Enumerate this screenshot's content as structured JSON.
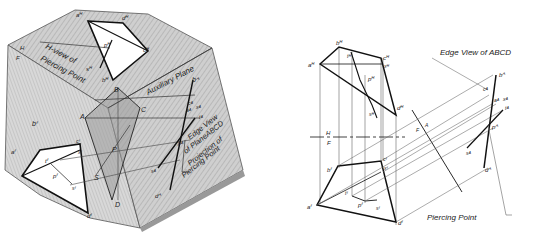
{
  "figure": {
    "left_panel": {
      "description": "Pictorial view of piercing point construction on a block",
      "captions": {
        "h_view": "H-view of",
        "h_view2": "Piercing Point",
        "aux_plane": "Auxiliary Plane",
        "edge_view1": "Edge View",
        "edge_view2": "of PlaneABCD",
        "projection1": "Projection of",
        "projection2": "Piercing Point",
        "h": "H",
        "f": "F"
      },
      "labels": {
        "aH": "aᴴ",
        "dH": "dᴴ",
        "pH": "pᴴ",
        "cH": "cᴴ",
        "sH": "sᴴ",
        "bH": "bᴴ",
        "A": "A",
        "B": "B",
        "C": "C",
        "D": "D",
        "P": "P",
        "S": "S",
        "X": "X",
        "T": "T",
        "bF": "bᶠ",
        "aF": "aᶠ",
        "cF": "cᶠ",
        "xF": "xᶠ",
        "tF": "tᶠ",
        "pF": "pᶠ",
        "sF": "sᶠ",
        "dF": "dᶠ",
        "bA": "bᴬ",
        "cA": "cᴬ",
        "aA": "aᴬ",
        "xA": "xᴬ",
        "tA": "tᴬ",
        "pA": "pᴬ",
        "sA": "sᴬ",
        "dA": "dᴬ"
      }
    },
    "right_panel": {
      "description": "Orthographic views: H (top), F (front), auxiliary view",
      "captions": {
        "edge_view": "Edge View of ABCD",
        "piercing_point": "Piercing Point",
        "h": "H",
        "f": "F",
        "fold_f": "F",
        "fold_a": "A"
      },
      "labels": {
        "bH": "bᴴ",
        "aH": "aᴴ",
        "cH": "cᴴ",
        "xH": "xᴴ",
        "tH": "tᴴ",
        "pH": "pᴴ",
        "sH": "sᴴ",
        "dH": "dᴴ",
        "bF": "bᶠ",
        "cF": "cᶠ",
        "xF": "xᶠ",
        "tF": "tᶠ",
        "pF": "pᶠ",
        "sF": "sᶠ",
        "aF": "aᶠ",
        "dF": "dᶠ",
        "bA": "bᴬ",
        "cA": "cᴬ",
        "aA": "aᴬ",
        "xA": "xᴬ",
        "tA": "tᴬ",
        "pA": "pᴬ",
        "sA": "sᴬ",
        "dA": "dᴬ"
      }
    }
  }
}
